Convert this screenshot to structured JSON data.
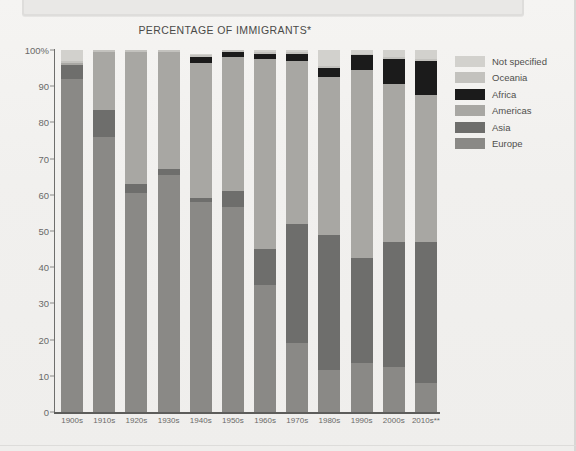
{
  "chart_title": "PERCENTAGE OF IMMIGRANTS*",
  "legend": {
    "items": [
      {
        "label": "Not specified",
        "color": "#d2d1cd"
      },
      {
        "label": "Oceania",
        "color": "#c3c2be"
      },
      {
        "label": "Africa",
        "color": "#1b1b1b"
      },
      {
        "label": "Americas",
        "color": "#a8a7a3"
      },
      {
        "label": "Asia",
        "color": "#6e6e6c"
      },
      {
        "label": "Europe",
        "color": "#8a8986"
      }
    ]
  },
  "axis": {
    "y_ticks": [
      "100%",
      "90",
      "80",
      "70",
      "60",
      "50",
      "40",
      "30",
      "20",
      "10",
      "0"
    ],
    "y_values": [
      100,
      90,
      80,
      70,
      60,
      50,
      40,
      30,
      20,
      10,
      0
    ],
    "x_labels": [
      "1900s",
      "1910s",
      "1920s",
      "1930s",
      "1940s",
      "1950s",
      "1960s",
      "1970s",
      "1980s",
      "1990s",
      "2000s",
      "2010s**"
    ]
  },
  "chart_data": {
    "type": "bar",
    "stacked": true,
    "title": "PERCENTAGE OF IMMIGRANTS*",
    "xlabel": "",
    "ylabel": "",
    "ylim": [
      0,
      100
    ],
    "grid": false,
    "legend_position": "right",
    "categories": [
      "1900s",
      "1910s",
      "1920s",
      "1930s",
      "1940s",
      "1950s",
      "1960s",
      "1970s",
      "1980s",
      "1990s",
      "2000s",
      "2010s**"
    ],
    "series": [
      {
        "name": "Europe",
        "color": "#8a8986",
        "values": [
          92.0,
          76.0,
          60.5,
          65.5,
          58.0,
          56.5,
          35.0,
          19.0,
          11.5,
          13.5,
          12.5,
          8.0
        ]
      },
      {
        "name": "Asia",
        "color": "#6e6e6c",
        "values": [
          4.0,
          7.5,
          2.5,
          1.5,
          1.0,
          4.5,
          10.0,
          33.0,
          37.5,
          29.0,
          34.5,
          39.0
        ]
      },
      {
        "name": "Americas",
        "color": "#a8a7a3",
        "values": [
          0.5,
          16.0,
          36.5,
          32.5,
          37.5,
          37.0,
          52.5,
          45.0,
          43.5,
          52.0,
          43.5,
          40.5
        ]
      },
      {
        "name": "Africa",
        "color": "#1b1b1b",
        "values": [
          0.0,
          0.0,
          0.0,
          0.0,
          1.5,
          1.5,
          1.5,
          2.0,
          2.5,
          4.0,
          7.0,
          9.5
        ]
      },
      {
        "name": "Oceania",
        "color": "#c3c2be",
        "values": [
          0.5,
          0.5,
          0.5,
          0.5,
          0.5,
          0.5,
          0.5,
          0.5,
          0.5,
          0.5,
          0.5,
          0.5
        ]
      },
      {
        "name": "Not specified",
        "color": "#d2d1cd",
        "values": [
          3.0,
          0.0,
          0.0,
          0.0,
          0.5,
          0.0,
          0.5,
          0.5,
          4.5,
          1.0,
          2.0,
          2.5
        ]
      }
    ]
  }
}
